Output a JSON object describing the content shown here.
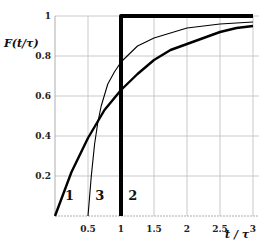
{
  "chart_data": {
    "type": "line",
    "title": "",
    "xlabel": "t / τ",
    "ylabel": "F(t/τ)",
    "xlim": [
      0,
      3
    ],
    "ylim": [
      0,
      1
    ],
    "grid": true,
    "x_ticks": [
      "0.5",
      "1",
      "1.5",
      "2",
      "2.5",
      "3"
    ],
    "y_ticks": [
      "0.2",
      "0.4",
      "0.6",
      "0.8",
      "1"
    ],
    "series": [
      {
        "name": "1",
        "style": "thick",
        "x": [
          0,
          0.25,
          0.5,
          0.75,
          1,
          1.25,
          1.5,
          1.75,
          2,
          2.25,
          2.5,
          2.75,
          3
        ],
        "y": [
          0,
          0.22,
          0.39,
          0.53,
          0.63,
          0.71,
          0.78,
          0.83,
          0.86,
          0.89,
          0.92,
          0.94,
          0.95
        ]
      },
      {
        "name": "2",
        "style": "very-thick-step",
        "x": [
          1,
          1,
          3
        ],
        "y": [
          0,
          1,
          1
        ]
      },
      {
        "name": "3",
        "style": "thin",
        "x": [
          0.5,
          0.55,
          0.6,
          0.65,
          0.7,
          0.8,
          0.9,
          1,
          1.25,
          1.5,
          2,
          2.5,
          3
        ],
        "y": [
          0,
          0.2,
          0.36,
          0.47,
          0.55,
          0.66,
          0.72,
          0.77,
          0.85,
          0.89,
          0.94,
          0.96,
          0.97
        ]
      }
    ],
    "annotations": [
      {
        "text": "1",
        "x": 0.22,
        "y": 0.08
      },
      {
        "text": "3",
        "x": 0.68,
        "y": 0.08
      },
      {
        "text": "2",
        "x": 1.18,
        "y": 0.08
      }
    ]
  }
}
